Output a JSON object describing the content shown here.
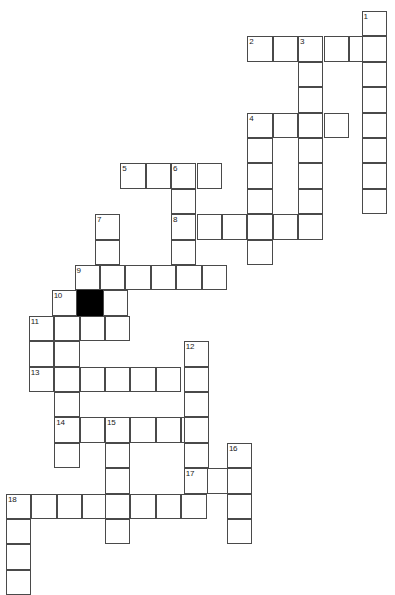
{
  "puzzle": {
    "title": "Crossword Puzzle Grid",
    "cell_size": 25.4,
    "origin_x": 6,
    "origin_y": 11,
    "columns": 16,
    "rows": 22,
    "colors": {
      "background": "#ffffff",
      "cell_fill": "#ffffff",
      "cell_border": "#4a4a4a",
      "block_fill": "#000000",
      "number_text": "#1a1a1a"
    },
    "cells": [
      {
        "row": 0,
        "col": 14,
        "number": "1"
      },
      {
        "row": 1,
        "col": 9.5,
        "number": "2"
      },
      {
        "row": 1,
        "col": 10.5
      },
      {
        "row": 1,
        "col": 11.5,
        "number": "3"
      },
      {
        "row": 1,
        "col": 12.5
      },
      {
        "row": 1,
        "col": 13.5
      },
      {
        "row": 1,
        "col": 14
      },
      {
        "row": 2,
        "col": 14
      },
      {
        "row": 2,
        "col": 11.5
      },
      {
        "row": 3,
        "col": 14
      },
      {
        "row": 3,
        "col": 11.5
      },
      {
        "row": 4,
        "col": 14
      },
      {
        "row": 4,
        "col": 9.5,
        "number": "4"
      },
      {
        "row": 4,
        "col": 10.5
      },
      {
        "row": 4,
        "col": 11.5
      },
      {
        "row": 4,
        "col": 12.5
      },
      {
        "row": 5,
        "col": 14
      },
      {
        "row": 5,
        "col": 9.5
      },
      {
        "row": 5,
        "col": 11.5
      },
      {
        "row": 6,
        "col": 14
      },
      {
        "row": 6,
        "col": 9.5
      },
      {
        "row": 6,
        "col": 11.5
      },
      {
        "row": 6,
        "col": 4.5,
        "number": "5"
      },
      {
        "row": 6,
        "col": 5.5
      },
      {
        "row": 6,
        "col": 6.5,
        "number": "6"
      },
      {
        "row": 6,
        "col": 7.5
      },
      {
        "row": 7,
        "col": 14
      },
      {
        "row": 7,
        "col": 9.5
      },
      {
        "row": 7,
        "col": 11.5
      },
      {
        "row": 7,
        "col": 6.5
      },
      {
        "row": 8,
        "col": 3.5,
        "number": "7"
      },
      {
        "row": 8,
        "col": 6.5,
        "number": "8"
      },
      {
        "row": 8,
        "col": 7.5
      },
      {
        "row": 8,
        "col": 8.5
      },
      {
        "row": 8,
        "col": 9.5
      },
      {
        "row": 8,
        "col": 10.5
      },
      {
        "row": 8,
        "col": 11.5
      },
      {
        "row": 9,
        "col": 3.5
      },
      {
        "row": 9,
        "col": 6.5
      },
      {
        "row": 9,
        "col": 9.5
      },
      {
        "row": 10,
        "col": 2.7,
        "number": "9"
      },
      {
        "row": 10,
        "col": 3.7
      },
      {
        "row": 10,
        "col": 4.7
      },
      {
        "row": 10,
        "col": 5.7
      },
      {
        "row": 10,
        "col": 6.7
      },
      {
        "row": 10,
        "col": 7.7
      },
      {
        "row": 11,
        "col": 1.8,
        "number": "10"
      },
      {
        "row": 11,
        "col": 2.8,
        "block": true
      },
      {
        "row": 11,
        "col": 3.8
      },
      {
        "row": 12,
        "col": 0.9,
        "number": "11"
      },
      {
        "row": 12,
        "col": 1.9
      },
      {
        "row": 12,
        "col": 2.9
      },
      {
        "row": 12,
        "col": 3.9
      },
      {
        "row": 13,
        "col": 0.9
      },
      {
        "row": 13,
        "col": 1.9
      },
      {
        "row": 13,
        "col": 7.0,
        "number": "12"
      },
      {
        "row": 14,
        "col": 0.9,
        "number": "13"
      },
      {
        "row": 14,
        "col": 1.9
      },
      {
        "row": 14,
        "col": 2.9
      },
      {
        "row": 14,
        "col": 3.9
      },
      {
        "row": 14,
        "col": 4.9
      },
      {
        "row": 14,
        "col": 5.9
      },
      {
        "row": 14,
        "col": 7.0
      },
      {
        "row": 15,
        "col": 1.9
      },
      {
        "row": 15,
        "col": 7.0
      },
      {
        "row": 16,
        "col": 1.9,
        "number": "14"
      },
      {
        "row": 16,
        "col": 2.9
      },
      {
        "row": 16,
        "col": 3.9,
        "number": "15"
      },
      {
        "row": 16,
        "col": 4.9
      },
      {
        "row": 16,
        "col": 5.9
      },
      {
        "row": 16,
        "col": 6.9
      },
      {
        "row": 16,
        "col": 7.0
      },
      {
        "row": 17,
        "col": 1.9
      },
      {
        "row": 17,
        "col": 3.9
      },
      {
        "row": 17,
        "col": 7.0
      },
      {
        "row": 17,
        "col": 8.7,
        "number": "16"
      },
      {
        "row": 18,
        "col": 3.9
      },
      {
        "row": 18,
        "col": 7.0,
        "number": "17"
      },
      {
        "row": 18,
        "col": 7.9
      },
      {
        "row": 18,
        "col": 8.7
      },
      {
        "row": 19,
        "col": 0,
        "number": "18"
      },
      {
        "row": 19,
        "col": 1
      },
      {
        "row": 19,
        "col": 2
      },
      {
        "row": 19,
        "col": 3
      },
      {
        "row": 19,
        "col": 3.9
      },
      {
        "row": 19,
        "col": 4.9
      },
      {
        "row": 19,
        "col": 5.9
      },
      {
        "row": 19,
        "col": 6.9
      },
      {
        "row": 19,
        "col": 8.7
      },
      {
        "row": 20,
        "col": 0
      },
      {
        "row": 20,
        "col": 3.9
      },
      {
        "row": 20,
        "col": 8.7
      },
      {
        "row": 21,
        "col": 0
      },
      {
        "row": 22,
        "col": 0
      }
    ]
  }
}
